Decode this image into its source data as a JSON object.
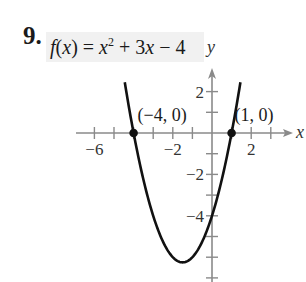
{
  "exercise": {
    "number": "9.",
    "function_parts": {
      "f": "f",
      "lhs_open": "(",
      "x": "x",
      "lhs_close": ") = ",
      "x2": "x",
      "exp": "2",
      "rest_a": " + 3",
      "x3": "x",
      "rest_b": " − 4"
    }
  },
  "chart_data": {
    "type": "line",
    "xlabel": "x",
    "ylabel": "y",
    "function": "x^2 + 3x - 4",
    "xlim": [
      -7,
      4
    ],
    "ylim": [
      -7,
      3
    ],
    "x_ticks": [
      -6,
      -5,
      -4,
      -3,
      -2,
      -1,
      1,
      2,
      3
    ],
    "y_ticks": [
      -7,
      -6,
      -5,
      -4,
      -3,
      -2,
      -1,
      1,
      2
    ],
    "x_tick_labels": [
      {
        "value": -6,
        "label": "−6"
      },
      {
        "value": -2,
        "label": "−2"
      },
      {
        "value": 2,
        "label": "2"
      }
    ],
    "y_tick_labels": [
      {
        "value": 2,
        "label": "2"
      },
      {
        "value": -2,
        "label": "−2"
      },
      {
        "value": -4,
        "label": "−4"
      }
    ],
    "grid": false,
    "legend": null,
    "vertex": {
      "x": -1.5,
      "y": -6.25
    },
    "points": [
      {
        "x": -4,
        "y": 0,
        "label": "(−4, 0)"
      },
      {
        "x": 1,
        "y": 0,
        "label": "(1, 0)"
      }
    ],
    "curve_x_range": [
      -4.45,
      1.45
    ],
    "colors": {
      "curve": "#111111",
      "axis": "#8a8a8a",
      "text": "#333333"
    }
  }
}
